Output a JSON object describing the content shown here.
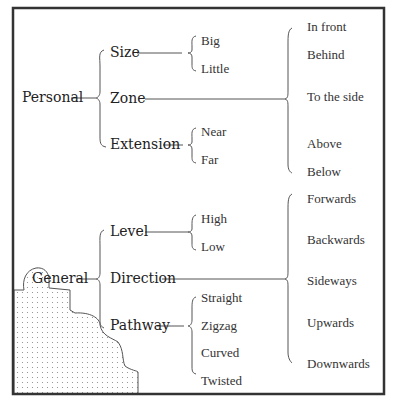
{
  "diagram": {
    "title": "",
    "roots": [
      {
        "label": "Personal",
        "children": [
          {
            "label": "Size",
            "children": [
              "Big",
              "Little"
            ]
          },
          {
            "label": "Zone",
            "children": []
          },
          {
            "label": "Extension",
            "children": [
              "Near",
              "Far"
            ]
          }
        ],
        "shared_children": [
          "In front",
          "Behind",
          "To the side",
          "Above",
          "Below"
        ]
      },
      {
        "label": "General",
        "children": [
          {
            "label": "Level",
            "children": [
              "High",
              "Low"
            ]
          },
          {
            "label": "Direction",
            "children": []
          },
          {
            "label": "Pathway",
            "children": [
              "Straight",
              "Zigzag",
              "Curved",
              "Twisted"
            ]
          }
        ],
        "shared_children": [
          "Forwards",
          "Backwards",
          "Sideways",
          "Upwards",
          "Downwards"
        ]
      }
    ],
    "colors": {
      "frame": "#333333",
      "line": "#555555",
      "text": "#222222",
      "dots": "#888888"
    }
  }
}
